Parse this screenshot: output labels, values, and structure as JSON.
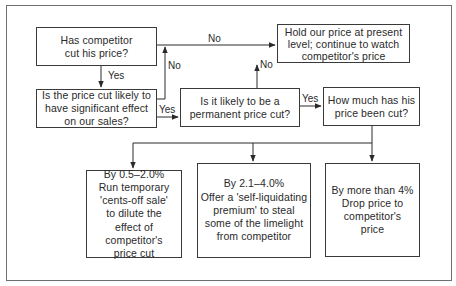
{
  "flowchart": {
    "nodes": {
      "q1": "Has competitor cut his price?",
      "q2": "Is the price cut likely to have significant effect on our sales?",
      "q3": "Is it likely to be a permanent price cut?",
      "hold": "Hold our price at present level; continue to watch competitor's price",
      "q4": "How much has his price been cut?",
      "opt1_title": "By 0.5–2.0%",
      "opt1_body": "Run temporary 'cents-off sale' to dilute the effect of competitor's price cut",
      "opt2_title": "By 2.1–4.0%",
      "opt2_body": "Offer a 'self-liquidating premium' to steal some of the limelight from competitor",
      "opt3_title": "By more than 4%",
      "opt3_body": "Drop price to competitor's price"
    },
    "edge_labels": {
      "q1_no": "No",
      "q1_yes": "Yes",
      "q2_no": "No",
      "q2_yes": "Yes",
      "q3_no": "No",
      "q3_yes": "Yes"
    },
    "colors": {
      "line": "#2a2a2a",
      "frame": "#6f6f6f",
      "background": "#ffffff"
    }
  }
}
